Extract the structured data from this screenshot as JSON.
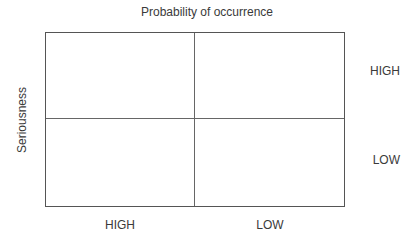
{
  "diagram": {
    "title": "Probability of occurrence",
    "y_axis_label": "Seriousness",
    "row_labels": [
      "HIGH",
      "LOW"
    ],
    "column_labels": [
      "HIGH",
      "LOW"
    ],
    "grid": {
      "rows": 2,
      "columns": 2
    }
  }
}
